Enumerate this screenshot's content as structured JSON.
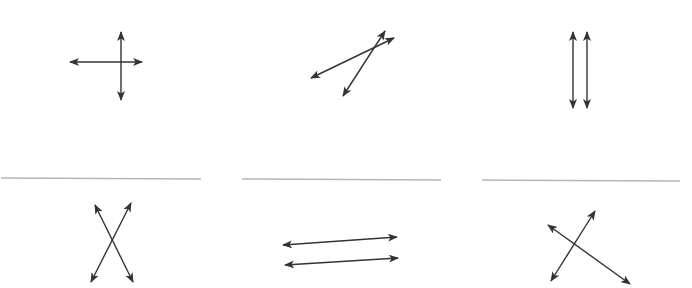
{
  "figure": {
    "colors": {
      "line": "#333333",
      "divider": "#b4b4b4",
      "background": "#ffffff"
    },
    "panels": [
      {
        "id": 1,
        "relation": "perpendicular",
        "lines": [
          {
            "x1": 70,
            "y1": 62,
            "x2": 142,
            "y2": 62
          },
          {
            "x1": 121,
            "y1": 32,
            "x2": 121,
            "y2": 100
          }
        ]
      },
      {
        "id": 2,
        "relation": "intersecting",
        "lines": [
          {
            "x1": 311,
            "y1": 78,
            "x2": 394,
            "y2": 38
          },
          {
            "x1": 343,
            "y1": 96,
            "x2": 385,
            "y2": 31
          }
        ]
      },
      {
        "id": 3,
        "relation": "parallel",
        "lines": [
          {
            "x1": 573,
            "y1": 32,
            "x2": 573,
            "y2": 108
          },
          {
            "x1": 587,
            "y1": 32,
            "x2": 587,
            "y2": 108
          }
        ]
      },
      {
        "id": 4,
        "relation": "intersecting",
        "lines": [
          {
            "x1": 95,
            "y1": 205,
            "x2": 133,
            "y2": 282
          },
          {
            "x1": 131,
            "y1": 203,
            "x2": 91,
            "y2": 282
          }
        ]
      },
      {
        "id": 5,
        "relation": "parallel",
        "lines": [
          {
            "x1": 283,
            "y1": 245,
            "x2": 397,
            "y2": 237
          },
          {
            "x1": 285,
            "y1": 265,
            "x2": 398,
            "y2": 258
          }
        ]
      },
      {
        "id": 6,
        "relation": "perpendicular",
        "lines": [
          {
            "x1": 548,
            "y1": 225,
            "x2": 630,
            "y2": 284
          },
          {
            "x1": 551,
            "y1": 281,
            "x2": 595,
            "y2": 211
          }
        ]
      }
    ],
    "dividers": [
      {
        "x1": 1,
        "y1": 178,
        "x2": 201,
        "y2": 179
      },
      {
        "x1": 242,
        "y1": 179,
        "x2": 441,
        "y2": 180
      },
      {
        "x1": 482,
        "y1": 180,
        "x2": 680,
        "y2": 181
      }
    ]
  }
}
